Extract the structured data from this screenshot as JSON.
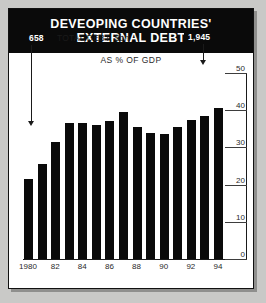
{
  "chart_data": {
    "type": "bar",
    "title": "DEVEOPING COUNTRIES' EXTERNAL DEBT",
    "title_lines": [
      "DEVEOPING COUNTRIES'",
      "EXTERNAL DEBT"
    ],
    "subtitle": "AS % OF GDP",
    "xlabel": "",
    "ylabel": "",
    "ylim": [
      0,
      50
    ],
    "yticks": [
      0,
      10,
      20,
      30,
      40,
      50
    ],
    "ytick_labels": [
      "0",
      "10",
      "20",
      "30",
      "40",
      "50"
    ],
    "grid": false,
    "legend": "none",
    "axis_position": "right",
    "categories": [
      1980,
      1981,
      1982,
      1983,
      1984,
      1985,
      1986,
      1987,
      1988,
      1989,
      1990,
      1991,
      1992,
      1993,
      1994
    ],
    "xtick_labels": [
      "1980",
      "82",
      "84",
      "86",
      "88",
      "90",
      "92",
      "94"
    ],
    "xtick_positions": [
      1980,
      1982,
      1984,
      1986,
      1988,
      1990,
      1992,
      1994
    ],
    "values": [
      21.5,
      25.5,
      31.5,
      36.5,
      36.5,
      36.0,
      37.0,
      39.5,
      35.5,
      34.0,
      33.5,
      35.5,
      37.5,
      38.5,
      40.5
    ],
    "series_label": "TOTAL DEBT, $bn",
    "annotations": [
      {
        "name": "start-total-debt",
        "value": "658",
        "year": 1980,
        "note": "total debt in $bn at start of series"
      },
      {
        "name": "end-total-debt",
        "value": "1,945",
        "year": 1994,
        "note": "total debt in $bn at end of series"
      }
    ],
    "colors": {
      "bar": "#0a0a0a",
      "background": "#ffffff",
      "title_band": "#0a0a0a",
      "title_text": "#ffffff",
      "axis": "#1a1a1a",
      "page": "#c9c9c7"
    }
  }
}
